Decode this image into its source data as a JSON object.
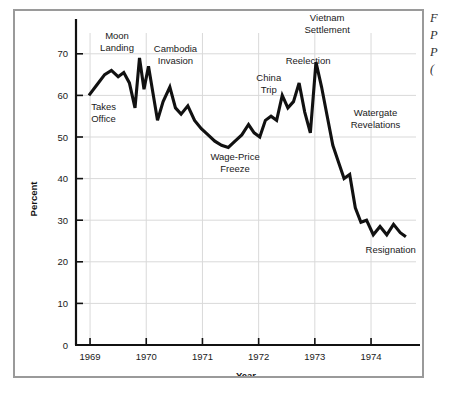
{
  "chart_data": {
    "type": "line",
    "title": "",
    "xlabel": "Year",
    "ylabel": "Percent",
    "xlim": [
      1968.75,
      1974.8
    ],
    "ylim": [
      0,
      75
    ],
    "yticks": [
      0,
      10,
      20,
      30,
      40,
      50,
      60,
      70
    ],
    "ytick_labels": [
      "0",
      "10",
      "20",
      "30",
      "40",
      "50",
      "60",
      "70"
    ],
    "xticks": [
      1969,
      1970,
      1971,
      1972,
      1973,
      1974
    ],
    "xtick_labels": [
      "1969",
      "1970",
      "1971",
      "1972",
      "1973",
      "1974"
    ],
    "grid": true,
    "legend": "none",
    "line_color": "#111111",
    "grid_color": "#d9d9d9",
    "axis_color": "#111111",
    "series": [
      {
        "name": "Presidential Approval",
        "x": [
          1968.98,
          1969.12,
          1969.26,
          1969.38,
          1969.5,
          1969.6,
          1969.7,
          1969.8,
          1969.88,
          1969.96,
          1970.04,
          1970.12,
          1970.2,
          1970.3,
          1970.42,
          1970.52,
          1970.62,
          1970.74,
          1970.86,
          1970.98,
          1971.1,
          1971.22,
          1971.34,
          1971.46,
          1971.58,
          1971.7,
          1971.82,
          1971.92,
          1972.02,
          1972.12,
          1972.22,
          1972.32,
          1972.42,
          1972.52,
          1972.62,
          1972.72,
          1972.82,
          1972.92,
          1973.02,
          1973.12,
          1973.22,
          1973.32,
          1973.42,
          1973.52,
          1973.62,
          1973.72,
          1973.82,
          1973.92,
          1974.04,
          1974.16,
          1974.28,
          1974.4,
          1974.52,
          1974.62
        ],
        "y": [
          60,
          62.5,
          65,
          66,
          64.5,
          65.5,
          63,
          57,
          69,
          61.5,
          67,
          60.5,
          54,
          58.5,
          62,
          57,
          55.5,
          57.5,
          54,
          52,
          50.5,
          49,
          48,
          47.5,
          49,
          50.5,
          53,
          51,
          50,
          54,
          55,
          54,
          60,
          57,
          58.5,
          63,
          56,
          51,
          68,
          62,
          55,
          48,
          44,
          40,
          41,
          33,
          29.5,
          30,
          26.5,
          28.5,
          26.5,
          29,
          27,
          26
        ]
      }
    ],
    "annotations": [
      {
        "text_lines": [
          "Takes",
          "Office"
        ],
        "x": 1969.02,
        "y": 56.5,
        "align": "start"
      },
      {
        "text_lines": [
          "Moon",
          "Landing"
        ],
        "x": 1969.48,
        "y": 73.5,
        "align": "middle"
      },
      {
        "text_lines": [
          "Cambodia",
          "Invasion"
        ],
        "x": 1970.52,
        "y": 70.5,
        "align": "middle"
      },
      {
        "text_lines": [
          "Wage-Price",
          "Freeze"
        ],
        "x": 1971.58,
        "y": 44.5,
        "align": "middle"
      },
      {
        "text_lines": [
          "China",
          "Trip"
        ],
        "x": 1972.18,
        "y": 63.5,
        "align": "middle"
      },
      {
        "text_lines": [
          "Reelection"
        ],
        "x": 1972.88,
        "y": 67.5,
        "align": "middle"
      },
      {
        "text_lines": [
          "Vietnam",
          "Settlement"
        ],
        "x": 1973.22,
        "y": 78,
        "align": "middle"
      },
      {
        "text_lines": [
          "Watergate",
          "Revelations"
        ],
        "x": 1974.08,
        "y": 55,
        "align": "middle"
      },
      {
        "text_lines": [
          "Resignation"
        ],
        "x": 1974.35,
        "y": 22,
        "align": "middle"
      }
    ]
  },
  "side_caption": {
    "lines": [
      "F",
      "P",
      "P",
      "("
    ]
  }
}
